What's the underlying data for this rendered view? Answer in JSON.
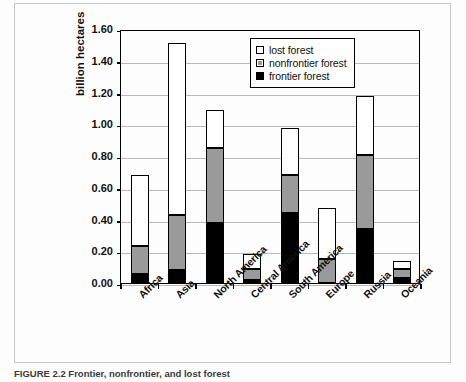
{
  "figure": {
    "caption": "FIGURE 2.2 Frontier, nonfrontier, and lost forest"
  },
  "chart_data": {
    "type": "bar",
    "stacked": true,
    "title": "",
    "xlabel": "",
    "ylabel": "billion hectares",
    "ylim": [
      0.0,
      1.6
    ],
    "yticks": [
      "0.00",
      "0.20",
      "0.40",
      "0.60",
      "0.80",
      "1.00",
      "1.20",
      "1.40",
      "1.60"
    ],
    "ytick_values": [
      0.0,
      0.2,
      0.4,
      0.6,
      0.8,
      1.0,
      1.2,
      1.4,
      1.6
    ],
    "grid": true,
    "legend_position": "top-right",
    "categories": [
      "Africa",
      "Asia",
      "North America",
      "Central America",
      "South America",
      "Europe",
      "Russia",
      "Oceania"
    ],
    "series": [
      {
        "name": "frontier forest",
        "color": "#000000",
        "values": [
          0.055,
          0.085,
          0.375,
          0.02,
          0.44,
          0.0,
          0.34,
          0.03
        ]
      },
      {
        "name": "nonfrontier forest",
        "color": "#9a9a9a",
        "values": [
          0.175,
          0.345,
          0.475,
          0.07,
          0.24,
          0.15,
          0.465,
          0.06
        ]
      },
      {
        "name": "lost forest",
        "color": "#ffffff",
        "values": [
          0.45,
          1.08,
          0.24,
          0.09,
          0.295,
          0.32,
          0.37,
          0.05
        ]
      }
    ],
    "totals": [
      0.68,
      1.51,
      1.09,
      0.18,
      0.975,
      0.47,
      1.175,
      0.14
    ]
  },
  "legend": {
    "items": [
      {
        "label": "lost forest",
        "swatch": "white-square-icon"
      },
      {
        "label": "nonfrontier forest",
        "swatch": "gray-square-icon"
      },
      {
        "label": "frontier forest",
        "swatch": "black-square-icon"
      }
    ]
  }
}
